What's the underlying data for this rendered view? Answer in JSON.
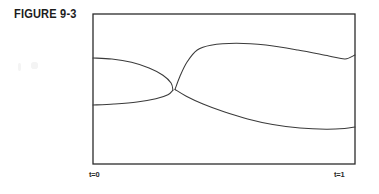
{
  "figure": {
    "label": "FIGURE 9-3",
    "caption_position": "top-left"
  },
  "frame": {
    "x": 93,
    "y": 14,
    "width": 262,
    "height": 150,
    "stroke_color": "#2b2b2b",
    "stroke_width": 1.2,
    "fill": "#ffffff"
  },
  "axis": {
    "left_label": "t=0",
    "right_label": "t=1"
  },
  "page": {
    "background": "#ffffff",
    "ink_color": "#3a3a3a"
  },
  "chart_data": {
    "type": "line",
    "title": "FIGURE 9-3",
    "xlabel": "",
    "ylabel": "",
    "xlim": [
      0,
      1
    ],
    "ylim": [
      0,
      1
    ],
    "grid": false,
    "legend": null,
    "tick_labels": {
      "x": [
        "t=0",
        "t=1"
      ]
    },
    "annotations": [],
    "series": [
      {
        "name": "left-lens-upper",
        "comment": "Upper boundary of left cusp region, from left edge to tip",
        "points": [
          [
            0.0,
            0.707
          ],
          [
            0.072,
            0.7
          ],
          [
            0.147,
            0.678
          ],
          [
            0.214,
            0.64
          ],
          [
            0.267,
            0.592
          ],
          [
            0.298,
            0.54
          ],
          [
            0.305,
            0.492
          ]
        ]
      },
      {
        "name": "left-lens-lower",
        "comment": "Lower boundary of left cusp region, from left edge to tip",
        "points": [
          [
            0.0,
            0.393
          ],
          [
            0.08,
            0.4
          ],
          [
            0.168,
            0.413
          ],
          [
            0.24,
            0.435
          ],
          [
            0.286,
            0.462
          ],
          [
            0.305,
            0.492
          ]
        ]
      },
      {
        "name": "right-lens-upper",
        "comment": "Upper boundary of large right region, from cusp to right edge",
        "points": [
          [
            0.313,
            0.497
          ],
          [
            0.332,
            0.585
          ],
          [
            0.359,
            0.68
          ],
          [
            0.398,
            0.76
          ],
          [
            0.45,
            0.792
          ],
          [
            0.546,
            0.805
          ],
          [
            0.66,
            0.793
          ],
          [
            0.782,
            0.76
          ],
          [
            0.9,
            0.72
          ],
          [
            0.962,
            0.7
          ],
          [
            1.0,
            0.727
          ]
        ]
      },
      {
        "name": "right-lens-lower",
        "comment": "Lower boundary of large right region, from cusp to right edge",
        "points": [
          [
            0.313,
            0.497
          ],
          [
            0.356,
            0.452
          ],
          [
            0.42,
            0.4
          ],
          [
            0.5,
            0.348
          ],
          [
            0.59,
            0.3
          ],
          [
            0.686,
            0.263
          ],
          [
            0.79,
            0.24
          ],
          [
            0.89,
            0.232
          ],
          [
            0.96,
            0.237
          ],
          [
            1.0,
            0.247
          ]
        ]
      }
    ]
  }
}
